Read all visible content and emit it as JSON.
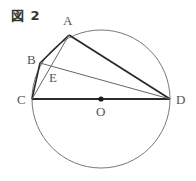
{
  "figure": {
    "title": "図 2"
  },
  "colors": {
    "circle": "#777777",
    "thick_line": "#2a2a2a",
    "thin_line": "#666666",
    "label": "#555555"
  },
  "points": {
    "A": {
      "label": "A",
      "x": 69,
      "y": 35
    },
    "B": {
      "label": "B",
      "x": 40,
      "y": 63
    },
    "C": {
      "label": "C",
      "x": 32,
      "y": 99
    },
    "D": {
      "label": "D",
      "x": 170,
      "y": 99
    },
    "E": {
      "label": "E",
      "x": 50,
      "y": 70
    },
    "O": {
      "label": "O",
      "x": 101,
      "y": 99
    }
  },
  "circle": {
    "cx": 101,
    "cy": 99,
    "r": 69
  },
  "segments": [
    {
      "from": "A",
      "to": "D",
      "style": "thick"
    },
    {
      "from": "C",
      "to": "D",
      "style": "thick"
    },
    {
      "from": "A",
      "to": "B",
      "style": "thick"
    },
    {
      "from": "B",
      "to": "C",
      "style": "thick"
    },
    {
      "from": "A",
      "to": "C",
      "style": "thin"
    },
    {
      "from": "B",
      "to": "D",
      "style": "thin"
    }
  ]
}
